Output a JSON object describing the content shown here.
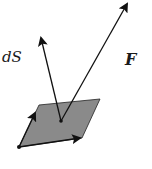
{
  "diagram": {
    "type": "vector-surface-element",
    "labels": {
      "surface_vector": "dS",
      "field_vector": "F"
    },
    "colors": {
      "surface_fill": "#8a8a8a",
      "stroke": "#111111",
      "background": "#ffffff"
    },
    "geometry": {
      "parallelogram": [
        [
          19,
          147
        ],
        [
          39,
          105
        ],
        [
          100,
          99
        ],
        [
          82,
          138
        ]
      ],
      "center": [
        61,
        121
      ],
      "ds_tip": [
        40,
        33
      ],
      "f_tip": [
        129,
        0
      ]
    }
  }
}
